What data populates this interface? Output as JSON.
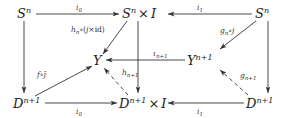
{
  "diagram": {
    "type": "commutative-diagram",
    "nodes": {
      "s_left": {
        "base": "S",
        "sup": "n",
        "suffix": ""
      },
      "s_mid": {
        "base": "S",
        "sup": "n",
        "suffix": " × I"
      },
      "s_right": {
        "base": "S",
        "sup": "n",
        "suffix": ""
      },
      "y": {
        "base": "Y",
        "sup": "",
        "suffix": ""
      },
      "y_n1": {
        "base": "Y",
        "sup": "n+1",
        "suffix": ""
      },
      "d_left": {
        "base": "D",
        "sup": "n+1",
        "suffix": ""
      },
      "d_mid": {
        "base": "D",
        "sup": "n+1",
        "suffix": " × I"
      },
      "d_right": {
        "base": "D",
        "sup": "n+1",
        "suffix": ""
      }
    },
    "edges": [
      {
        "id": "top-i0",
        "from": "s_left",
        "to": "s_mid",
        "label": "i",
        "sub": "0",
        "style": "solid"
      },
      {
        "id": "top-i1",
        "from": "s_right",
        "to": "s_mid",
        "label": "i",
        "sub": "1",
        "style": "solid"
      },
      {
        "id": "left-vert",
        "from": "s_left",
        "to": "d_left",
        "label": "",
        "style": "solid"
      },
      {
        "id": "mid-vert",
        "from": "s_mid",
        "to": "d_mid",
        "label": "",
        "style": "solid"
      },
      {
        "id": "right-vert",
        "from": "s_right",
        "to": "d_right",
        "label": "",
        "style": "solid"
      },
      {
        "id": "h-n",
        "from": "s_mid",
        "to": "y",
        "label": "h",
        "sub": "n",
        "post": "∘(j×id)",
        "style": "solid"
      },
      {
        "id": "g-n",
        "from": "s_right",
        "to": "y_n1",
        "label": "g",
        "sub": "n",
        "post": "∘j",
        "style": "solid"
      },
      {
        "id": "i-n1",
        "from": "y_n1",
        "to": "y",
        "label": "ι",
        "sub": "n+1",
        "style": "solid"
      },
      {
        "id": "f-jbar",
        "from": "d_left",
        "to": "y",
        "label": "f∘j̄",
        "style": "solid"
      },
      {
        "id": "h-n1",
        "from": "d_mid",
        "to": "y",
        "label": "h",
        "sub": "n+1",
        "style": "dashed"
      },
      {
        "id": "g-n1",
        "from": "d_right",
        "to": "y_n1",
        "label": "g",
        "sub": "n+1",
        "style": "dashed"
      },
      {
        "id": "bot-i0",
        "from": "d_left",
        "to": "d_mid",
        "label": "i",
        "sub": "0",
        "style": "solid"
      },
      {
        "id": "bot-i1",
        "from": "d_right",
        "to": "d_mid",
        "label": "i",
        "sub": "1",
        "style": "solid"
      }
    ]
  },
  "text": {
    "s_left": {
      "base": "S",
      "sup": "n"
    },
    "s_mid": {
      "base": "S",
      "sup": "n",
      "times": "×",
      "i": "I"
    },
    "s_right": {
      "base": "S",
      "sup": "n"
    },
    "y": {
      "base": "Y"
    },
    "y_n1": {
      "base": "Y",
      "sup": "n+1"
    },
    "d_left": {
      "base": "D",
      "sup": "n+1"
    },
    "d_mid": {
      "base": "D",
      "sup": "n+1",
      "times": "×",
      "i": "I"
    },
    "d_right": {
      "base": "D",
      "sup": "n+1"
    },
    "lbl_top_i0": {
      "base": "i",
      "sub": "0"
    },
    "lbl_top_i1": {
      "base": "i",
      "sub": "1"
    },
    "lbl_hn": {
      "base": "h",
      "sub": "n",
      "post": "∘(",
      "j": "j",
      "x": "×",
      "id": "id",
      "close": ")"
    },
    "lbl_gn": {
      "base": "g",
      "sub": "n",
      "post": "∘",
      "j": "j"
    },
    "lbl_in1": {
      "base": "ι",
      "sub": "n+1"
    },
    "lbl_fj": {
      "f": "f",
      "op": "∘",
      "j": "j̄"
    },
    "lbl_hn1": {
      "base": "h",
      "sub": "n+1"
    },
    "lbl_gn1": {
      "base": "g",
      "sub": "n+1"
    },
    "lbl_bot_i0": {
      "base": "i",
      "sub": "0"
    },
    "lbl_bot_i1": {
      "base": "i",
      "sub": "1"
    }
  }
}
